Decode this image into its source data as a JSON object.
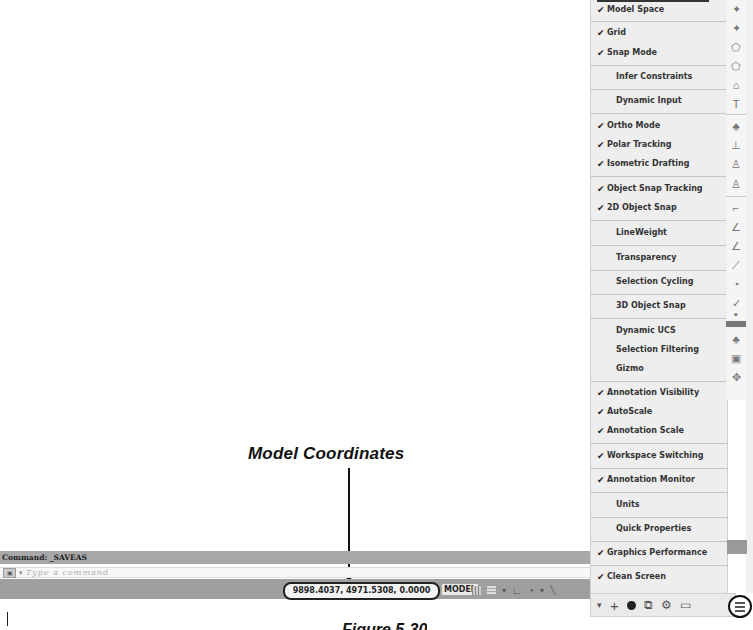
{
  "callout": {
    "label": "Model Coordinates"
  },
  "command_line": {
    "history": "Command:  _SAVEAS",
    "input_placeholder": "Type a command",
    "icon": "command-prompt-icon",
    "dropdown_arrow": "▾"
  },
  "status_bar": {
    "coordinates": "9898.4037, 4971.5308, 0.0000",
    "model_label": "MODEL",
    "icons": [
      "grid-icon",
      "snap-mode-icon",
      "dropdown-icon",
      "ortho-icon",
      "polar-tracking-icon",
      "dropdown-icon",
      "isometric-icon"
    ]
  },
  "customization_menu": {
    "items": [
      {
        "label": "Model Space",
        "checked": true
      },
      {
        "label": "Grid",
        "checked": true
      },
      {
        "label": "Snap Mode",
        "checked": true
      },
      {
        "label": "Infer Constraints",
        "checked": false
      },
      {
        "label": "Dynamic Input",
        "checked": false
      },
      {
        "label": "Ortho Mode",
        "checked": true
      },
      {
        "label": "Polar Tracking",
        "checked": true
      },
      {
        "label": "Isometric Drafting",
        "checked": true
      },
      {
        "label": "Object Snap Tracking",
        "checked": true
      },
      {
        "label": "2D Object Snap",
        "checked": true
      },
      {
        "label": "LineWeight",
        "checked": false
      },
      {
        "label": "Transparency",
        "checked": false
      },
      {
        "label": "Selection Cycling",
        "checked": false
      },
      {
        "label": "3D Object Snap",
        "checked": false
      },
      {
        "label": "Dynamic UCS",
        "checked": false
      },
      {
        "label": "Selection Filtering",
        "checked": false
      },
      {
        "label": "Gizmo",
        "checked": false
      },
      {
        "label": "Annotation Visibility",
        "checked": true
      },
      {
        "label": "AutoScale",
        "checked": true
      },
      {
        "label": "Annotation Scale",
        "checked": true
      },
      {
        "label": "Workspace Switching",
        "checked": true
      },
      {
        "label": "Annotation Monitor",
        "checked": true
      },
      {
        "label": "Units",
        "checked": false
      },
      {
        "label": "Quick Properties",
        "checked": false
      },
      {
        "label": "Graphics Performance",
        "checked": true
      },
      {
        "label": "Clean Screen",
        "checked": true
      }
    ],
    "check_glyph": "✔"
  },
  "bottom_toolbar": {
    "icons": [
      "dropdown-icon",
      "plus-icon",
      "hardware-acceleration-icon",
      "isolate-objects-icon",
      "workspace-icon",
      "clean-screen-icon",
      "customization-menu-icon"
    ],
    "glyphs": [
      "▾",
      "+",
      "",
      "⧉",
      "⚙",
      "▭"
    ]
  },
  "icon_column": {
    "glyphs": [
      "✦",
      "✦",
      "⬠",
      "⬠",
      "⌂",
      "T",
      "♣",
      "⊥",
      "♙",
      "♙",
      "⌐",
      "∠",
      "∠",
      "⟋",
      "◔",
      "✓",
      "▪",
      "♣",
      "▣",
      "✥"
    ]
  },
  "caption": {
    "text": "Figure 5-30"
  }
}
